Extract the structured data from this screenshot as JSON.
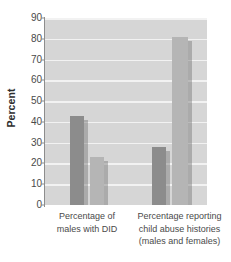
{
  "chart_data": {
    "type": "bar",
    "title": "",
    "xlabel": "",
    "ylabel": "Percent",
    "ylim": [
      0,
      90
    ],
    "ytick_step": 10,
    "yticks": [
      90,
      80,
      70,
      60,
      50,
      40,
      30,
      20,
      10,
      0
    ],
    "grid": true,
    "legend": "none",
    "categories": [
      "Percentage of males with DID",
      "Percentage reporting child abuse histories (males and females)"
    ],
    "category_label_lines": [
      [
        "Percentage of",
        "males with DID"
      ],
      [
        "Percentage reporting",
        "child abuse histories",
        "(males and females)"
      ]
    ],
    "series": [
      {
        "name": "series-dark",
        "values": [
          43,
          28
        ],
        "color": "#8c8c8c"
      },
      {
        "name": "series-light",
        "values": [
          23,
          81
        ],
        "color": "#b5b5b5"
      }
    ],
    "bars": [
      {
        "group": 0,
        "series": 0,
        "value": 43,
        "color": "#8c8c8c",
        "x": 25,
        "width": 14
      },
      {
        "group": 0,
        "series": 1,
        "value": 23,
        "color": "#b5b5b5",
        "x": 45,
        "width": 14
      },
      {
        "group": 1,
        "series": 0,
        "value": 28,
        "color": "#8c8c8c",
        "x": 107,
        "width": 14
      },
      {
        "group": 1,
        "series": 1,
        "value": 81,
        "color": "#b5b5b5",
        "x": 127,
        "width": 16
      }
    ],
    "plot_background": "#d6d6d6",
    "gridline_color": "#f2f2f2",
    "axis_color": "#8d8d8d"
  }
}
